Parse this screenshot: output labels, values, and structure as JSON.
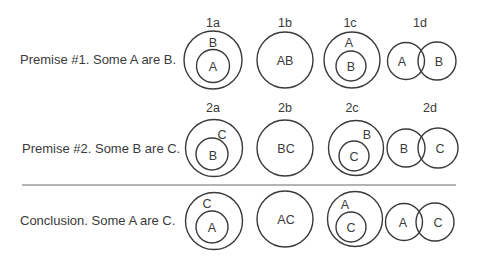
{
  "rows": [
    {
      "label": "Premise #1. Some A are B.",
      "columns": [
        {
          "id": "1a",
          "outer": "B",
          "inner": "A"
        },
        {
          "id": "1b",
          "combined": "AB"
        },
        {
          "id": "1c",
          "outer": "A",
          "inner": "B"
        },
        {
          "id": "1d",
          "left": "A",
          "right": "B"
        }
      ]
    },
    {
      "label": "Premise #2. Some B are C.",
      "columns": [
        {
          "id": "2a",
          "outer": "C",
          "inner": "B"
        },
        {
          "id": "2b",
          "combined": "BC"
        },
        {
          "id": "2c",
          "outer": "B",
          "inner": "C"
        },
        {
          "id": "2d",
          "left": "B",
          "right": "C"
        }
      ]
    },
    {
      "label": "Conclusion. Some A are C.",
      "columns": [
        {
          "outer": "C",
          "inner": "A"
        },
        {
          "combined": "AC"
        },
        {
          "outer": "A",
          "inner": "C"
        },
        {
          "left": "A",
          "right": "C"
        }
      ]
    }
  ],
  "colors": {
    "stroke": "#3a3a3a",
    "text": "#3a3a3a",
    "divider": "#6a6a6a",
    "background": "#ffffff"
  }
}
